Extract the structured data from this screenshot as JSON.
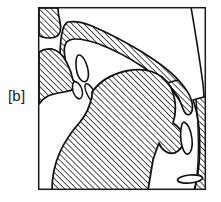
{
  "figure": {
    "kind": "sagittal-vocal-tract-diagram",
    "phoneme_label": "[b]",
    "frame": {
      "x": 38,
      "y": 7,
      "width": 168,
      "height": 183,
      "stroke_color": "#1a1a1a",
      "stroke_width": 1.5,
      "fill_color": "#ffffff"
    },
    "style": {
      "outline_color": "#111111",
      "hatch_color": "#1a1a1a",
      "hatch_angle_deg": 45,
      "hatch_spacing_px": 3,
      "tissue_fill": "#ffffff",
      "background": "#ffffff"
    },
    "structures": [
      {
        "name": "upper-lip",
        "hatched": true
      },
      {
        "name": "lower-lip",
        "hatched": true
      },
      {
        "name": "hard-palate",
        "hatched": true
      },
      {
        "name": "velum",
        "hatched": true
      },
      {
        "name": "upper-teeth",
        "hatched": false
      },
      {
        "name": "lower-teeth",
        "hatched": false
      },
      {
        "name": "tongue",
        "hatched": true
      },
      {
        "name": "jaw-floor-of-mouth",
        "hatched": true
      },
      {
        "name": "pharyngeal-wall",
        "hatched": true
      },
      {
        "name": "epiglottis",
        "hatched": false
      },
      {
        "name": "head-outline-curve",
        "hatched": false
      },
      {
        "name": "hyoid-ellipse",
        "hatched": false
      }
    ]
  }
}
